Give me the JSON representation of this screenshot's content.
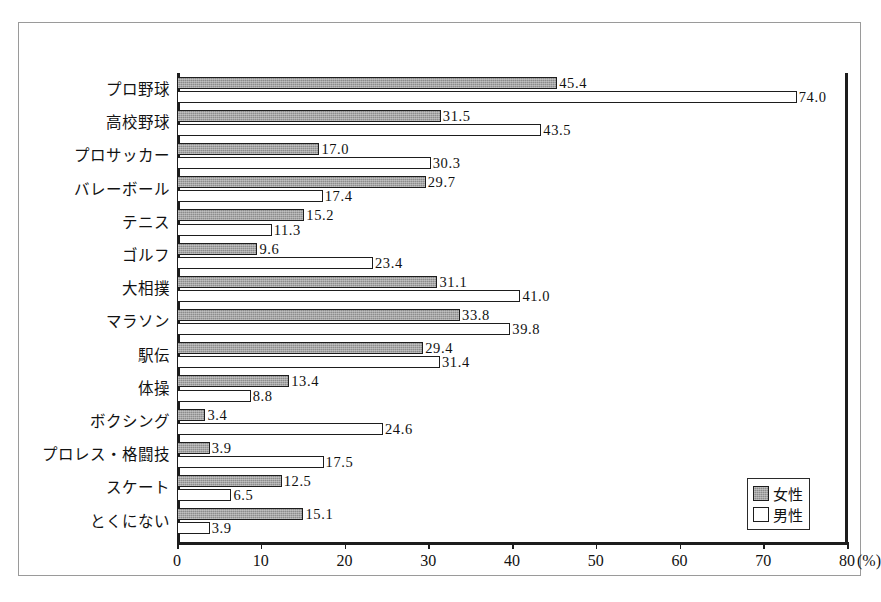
{
  "chart_data": {
    "type": "bar",
    "orientation": "horizontal",
    "title": "",
    "xlabel": "(%)",
    "ylabel": "",
    "xlim": [
      0,
      80
    ],
    "xticks": [
      0,
      10,
      20,
      30,
      40,
      50,
      60,
      70,
      80
    ],
    "xtick_labels": [
      "0",
      "10",
      "20",
      "30",
      "40",
      "50",
      "60",
      "70",
      "80"
    ],
    "unit_label": "(%)",
    "grid": false,
    "legend_position": "bottom-right",
    "categories": [
      "プロ野球",
      "高校野球",
      "プロサッカー",
      "バレーボール",
      "テニス",
      "ゴルフ",
      "大相撲",
      "マラソン",
      "駅伝",
      "体操",
      "ボクシング",
      "プロレス・格闘技",
      "スケート",
      "とくにない"
    ],
    "series": [
      {
        "name": "女性",
        "color": "#8c8c8c",
        "values": [
          45.4,
          31.5,
          17.0,
          29.7,
          15.2,
          9.6,
          31.1,
          33.8,
          29.4,
          13.4,
          3.4,
          3.9,
          12.5,
          15.1
        ],
        "labels": [
          "45.4",
          "31.5",
          "17.0",
          "29.7",
          "15.2",
          "9.6",
          "31.1",
          "33.8",
          "29.4",
          "13.4",
          "3.4",
          "3.9",
          "12.5",
          "15.1"
        ]
      },
      {
        "name": "男性",
        "color": "#ffffff",
        "values": [
          74.0,
          43.5,
          30.3,
          17.4,
          11.3,
          23.4,
          41.0,
          39.8,
          31.4,
          8.8,
          24.6,
          17.5,
          6.5,
          3.9
        ],
        "labels": [
          "74.0",
          "43.5",
          "30.3",
          "17.4",
          "11.3",
          "23.4",
          "41.0",
          "39.8",
          "31.4",
          "8.8",
          "24.6",
          "17.5",
          "6.5",
          "3.9"
        ]
      }
    ]
  },
  "legend": {
    "entries": [
      {
        "label": "女性",
        "swatch": "female"
      },
      {
        "label": "男性",
        "swatch": "male"
      }
    ]
  }
}
